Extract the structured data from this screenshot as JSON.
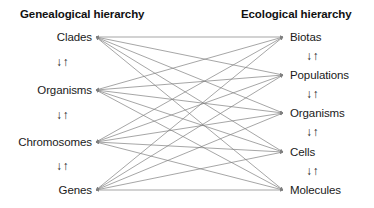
{
  "figure": {
    "type": "bipartite-hierarchy-diagram",
    "background_color": "#ffffff",
    "edge_color": "#808080",
    "text_color": "#1a1a1a",
    "width": 374,
    "height": 208
  },
  "columns": {
    "left": {
      "title": "Genealogical hierarchy",
      "anchor_x": 96,
      "nodes": [
        {
          "label": "Clades",
          "y": 37
        },
        {
          "label": "Organisms",
          "y": 90
        },
        {
          "label": "Chromosomes",
          "y": 142
        },
        {
          "label": "Genes",
          "y": 190
        }
      ],
      "vertical_connectors": [
        {
          "glyph": "↓↑",
          "y": 62
        },
        {
          "glyph": "↓↑",
          "y": 115
        },
        {
          "glyph": "↓↑",
          "y": 166
        }
      ]
    },
    "right": {
      "title": "Ecological hierarchy",
      "anchor_x": 283,
      "nodes": [
        {
          "label": "Biotas",
          "y": 37
        },
        {
          "label": "Populations",
          "y": 75
        },
        {
          "label": "Organisms",
          "y": 113
        },
        {
          "label": "Cells",
          "y": 152
        },
        {
          "label": "Molecules",
          "y": 190
        }
      ],
      "vertical_connectors": [
        {
          "glyph": "↓↑",
          "y": 56
        },
        {
          "glyph": "↓↑",
          "y": 94
        },
        {
          "glyph": "↓↑",
          "y": 132
        },
        {
          "glyph": "↓↑",
          "y": 171
        }
      ]
    }
  },
  "edges": {
    "description": "every left node connects bidirectionally to every right node",
    "pairs": [
      [
        "Clades",
        "Biotas"
      ],
      [
        "Clades",
        "Populations"
      ],
      [
        "Clades",
        "Organisms"
      ],
      [
        "Clades",
        "Cells"
      ],
      [
        "Clades",
        "Molecules"
      ],
      [
        "Organisms",
        "Biotas"
      ],
      [
        "Organisms",
        "Populations"
      ],
      [
        "Organisms",
        "Organisms"
      ],
      [
        "Organisms",
        "Cells"
      ],
      [
        "Organisms",
        "Molecules"
      ],
      [
        "Chromosomes",
        "Biotas"
      ],
      [
        "Chromosomes",
        "Populations"
      ],
      [
        "Chromosomes",
        "Organisms"
      ],
      [
        "Chromosomes",
        "Cells"
      ],
      [
        "Chromosomes",
        "Molecules"
      ],
      [
        "Genes",
        "Biotas"
      ],
      [
        "Genes",
        "Populations"
      ],
      [
        "Genes",
        "Organisms"
      ],
      [
        "Genes",
        "Cells"
      ],
      [
        "Genes",
        "Molecules"
      ]
    ]
  }
}
